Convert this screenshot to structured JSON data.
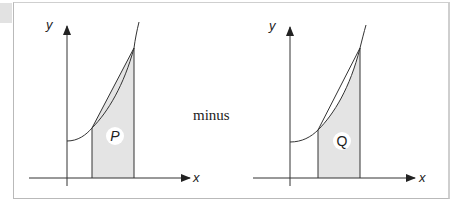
{
  "figure": {
    "operator_text": "minus",
    "colors": {
      "line": "#333333",
      "shade": "#e4e4e4",
      "label_bg": "#ffffff",
      "frame": "#c4c4c4",
      "corner_tab": "#e2e2e2"
    },
    "left_panel": {
      "y_axis_label": "y",
      "x_axis_label": "x",
      "region_label": "P",
      "shading": "area under chord (trapezoid)"
    },
    "right_panel": {
      "y_axis_label": "y",
      "x_axis_label": "x",
      "region_label": "Q",
      "shading": "area under curve"
    }
  }
}
